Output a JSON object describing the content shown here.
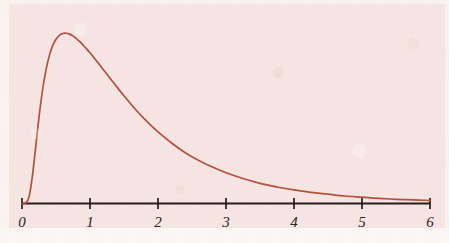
{
  "figure": {
    "title": "",
    "background_color": "#f6e5e3",
    "curve_color": "#b5503c",
    "axis_color": "#241d1a",
    "label_color": "#2a2320"
  },
  "axis": {
    "name": "x-axis",
    "tick_labels": [
      "0",
      "1",
      "2",
      "3",
      "4",
      "5",
      "6"
    ],
    "tick_values": [
      0,
      1,
      2,
      3,
      4,
      5,
      6
    ],
    "x_min": 0,
    "x_max": 6
  },
  "chart_data": {
    "type": "line",
    "title": "",
    "subtitle": "",
    "xlabel": "",
    "ylabel": "",
    "xlim": [
      0,
      6
    ],
    "ylim": [
      0,
      0.62
    ],
    "grid": false,
    "legend": null,
    "annotations": [],
    "x_tick_labels": [
      "0",
      "1",
      "2",
      "3",
      "4",
      "5",
      "6"
    ],
    "y_tick_labels": [],
    "series": [
      {
        "name": "density",
        "color": "#b5503c",
        "x": [
          0.0,
          0.05,
          0.1,
          0.15,
          0.2,
          0.25,
          0.3,
          0.35,
          0.4,
          0.45,
          0.5,
          0.55,
          0.6,
          0.65,
          0.7,
          0.75,
          0.8,
          0.85,
          0.9,
          0.95,
          1.0,
          1.1,
          1.2,
          1.3,
          1.4,
          1.5,
          1.6,
          1.7,
          1.8,
          1.9,
          2.0,
          2.2,
          2.4,
          2.6,
          2.8,
          3.0,
          3.25,
          3.5,
          3.75,
          4.0,
          4.25,
          4.5,
          4.75,
          5.0,
          5.25,
          5.5,
          5.75,
          6.0
        ],
        "y": [
          0.0,
          0.001,
          0.019,
          0.086,
          0.185,
          0.287,
          0.374,
          0.441,
          0.49,
          0.524,
          0.546,
          0.559,
          0.565,
          0.566,
          0.563,
          0.557,
          0.548,
          0.538,
          0.526,
          0.514,
          0.501,
          0.473,
          0.444,
          0.415,
          0.386,
          0.358,
          0.331,
          0.305,
          0.281,
          0.259,
          0.238,
          0.201,
          0.169,
          0.143,
          0.121,
          0.102,
          0.083,
          0.067,
          0.055,
          0.045,
          0.037,
          0.031,
          0.025,
          0.021,
          0.017,
          0.014,
          0.012,
          0.01
        ]
      }
    ]
  }
}
